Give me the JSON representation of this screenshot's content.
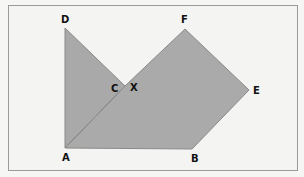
{
  "diagram": {
    "type": "geometry",
    "colors": {
      "background": "#f4f4f2",
      "frame": "#9a9a9a",
      "fill": "#a9a9a9",
      "stroke": "#8a8a8a",
      "label": "#111111"
    },
    "vertices": {
      "A": {
        "x": 65,
        "y": 148
      },
      "B": {
        "x": 192,
        "y": 149
      },
      "C": {
        "x": 125,
        "y": 86
      },
      "D": {
        "x": 65,
        "y": 28
      },
      "E": {
        "x": 249,
        "y": 90
      },
      "F": {
        "x": 185,
        "y": 29
      },
      "X": {
        "x": 125,
        "y": 86
      }
    },
    "shapes": [
      {
        "name": "triangle-ACD",
        "points": [
          "A",
          "C",
          "D"
        ]
      },
      {
        "name": "polygon-ABEFX",
        "points": [
          "A",
          "B",
          "E",
          "F",
          "X"
        ]
      }
    ],
    "labels": [
      {
        "text": "D",
        "x": 61,
        "y": 23
      },
      {
        "text": "F",
        "x": 181,
        "y": 23
      },
      {
        "text": "C",
        "x": 111,
        "y": 92
      },
      {
        "text": "X",
        "x": 130,
        "y": 91
      },
      {
        "text": "E",
        "x": 253,
        "y": 94
      },
      {
        "text": "A",
        "x": 62,
        "y": 161
      },
      {
        "text": "B",
        "x": 191,
        "y": 162
      }
    ]
  }
}
